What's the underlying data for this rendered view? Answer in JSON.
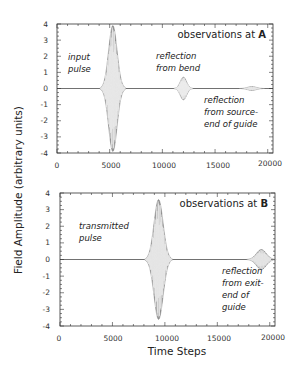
{
  "chart_data": [
    {
      "type": "line",
      "title": "observations at A",
      "title_prefix": "observations at ",
      "title_bold": "A",
      "xlabel": "Time Steps",
      "ylabel": "Field Amplitude  (arbitrary units)",
      "xlim": [
        0,
        20500
      ],
      "ylim": [
        -4,
        4
      ],
      "x_ticks": [
        0,
        5000,
        10000,
        15000,
        20000
      ],
      "y_ticks": [
        4,
        3,
        2,
        1,
        0,
        -1,
        -2,
        -3,
        -4
      ],
      "grid": false,
      "series": [
        {
          "name": "input pulse",
          "center": 5300,
          "halfwidth": 1200,
          "amplitude": 3.9
        },
        {
          "name": "reflection from bend",
          "center": 12000,
          "halfwidth": 900,
          "amplitude": 0.7
        },
        {
          "name": "reflection from source-end of guide",
          "center": 18500,
          "halfwidth": 1200,
          "amplitude": 0.12
        }
      ],
      "annotations": [
        {
          "text": [
            "input",
            "pulse"
          ]
        },
        {
          "text": [
            "reflection",
            "from bend"
          ]
        },
        {
          "text": [
            "reflection",
            "from source-",
            "end of guide"
          ]
        }
      ]
    },
    {
      "type": "line",
      "title": "observations at B",
      "title_prefix": "observations at ",
      "title_bold": "B",
      "xlabel": "Time Steps",
      "ylabel": "Field Amplitude  (arbitrary units)",
      "xlim": [
        0,
        20500
      ],
      "ylim": [
        -4,
        4
      ],
      "x_ticks": [
        0,
        5000,
        10000,
        15000,
        20000
      ],
      "y_ticks": [
        4,
        3,
        2,
        1,
        0,
        -1,
        -2,
        -3,
        -4
      ],
      "grid": false,
      "series": [
        {
          "name": "transmitted pulse",
          "center": 9400,
          "halfwidth": 1300,
          "amplitude": 3.6
        },
        {
          "name": "reflection from exit-end of guide",
          "center": 19200,
          "halfwidth": 1400,
          "amplitude": 0.6
        }
      ],
      "annotations": [
        {
          "text": [
            "transmitted",
            "pulse"
          ]
        },
        {
          "text": [
            "reflection",
            "from exit-",
            "end of",
            "guide"
          ]
        }
      ]
    }
  ],
  "labels": {
    "ylabel": "Field Amplitude  (arbitrary units)",
    "xlabel": "Time Steps",
    "top_title_prefix": "observations at ",
    "top_title_bold": "A",
    "bottom_title_prefix": "observations at ",
    "bottom_title_bold": "B",
    "ann_input_1": "input",
    "ann_input_2": "pulse",
    "ann_bend_1": "reflection",
    "ann_bend_2": "from bend",
    "ann_source_1": "reflection",
    "ann_source_2": "from source-",
    "ann_source_3": "end of guide",
    "ann_trans_1": "transmitted",
    "ann_trans_2": "pulse",
    "ann_exit_1": "reflection",
    "ann_exit_2": "from exit-",
    "ann_exit_3": "end of",
    "ann_exit_4": "guide",
    "xt0": "0",
    "xt1": "5000",
    "xt2": "10000",
    "xt3": "15000",
    "xt4": "20000",
    "yt0": "4",
    "yt1": "3",
    "yt2": "2",
    "yt3": "1",
    "yt4": "0",
    "yt5": "-1",
    "yt6": "-2",
    "yt7": "-3",
    "yt8": "-4"
  },
  "colors": {
    "pulse_fill": "#9a9a9a",
    "pulse_line": "#333333",
    "axis": "#333333"
  }
}
